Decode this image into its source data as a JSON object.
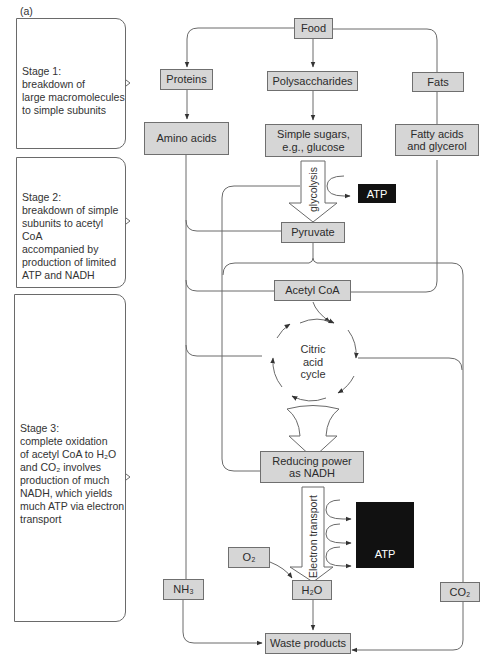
{
  "panel_label": "(a)",
  "stages": [
    {
      "title": "Stage 1:",
      "lines": [
        "breakdown of",
        "large macromolecules",
        "to simple subunits"
      ]
    },
    {
      "title": "Stage 2:",
      "lines": [
        "breakdown of simple",
        "subunits to acetyl CoA",
        "accompanied by",
        "production of limited",
        "ATP and NADH"
      ]
    },
    {
      "title": "Stage 3:",
      "lines": [
        "complete oxidation",
        "of  acetyl CoA to H₂O",
        "and CO₂ involves",
        "production of much",
        "NADH, which yields",
        "much ATP via electron",
        "transport"
      ]
    }
  ],
  "nodes": {
    "food": "Food",
    "proteins": "Proteins",
    "polysaccharides": "Polysaccharides",
    "fats": "Fats",
    "amino_acids": "Amino acids",
    "simple_sugars_l1": "Simple sugars,",
    "simple_sugars_l2": "e.g., glucose",
    "fatty_acids_l1": "Fatty acids",
    "fatty_acids_l2": "and glycerol",
    "pyruvate": "Pyruvate",
    "acetyl_coa": "Acetyl CoA",
    "citric_l1": "Citric",
    "citric_l2": "acid",
    "citric_l3": "cycle",
    "nadh_l1": "Reducing power",
    "nadh_l2": "as NADH",
    "o2": "O₂",
    "h2o": "H₂O",
    "nh3": "NH₃",
    "co2": "CO₂",
    "waste": "Waste products"
  },
  "processes": {
    "glycolysis": "glycolysis",
    "electron_transport": "Electron transport"
  },
  "outputs": {
    "atp_small": "ATP",
    "atp_large": "ATP"
  },
  "colors": {
    "node_fill": "#d6d6d6",
    "atp_fill": "#111111",
    "line": "#6a6a6a"
  }
}
